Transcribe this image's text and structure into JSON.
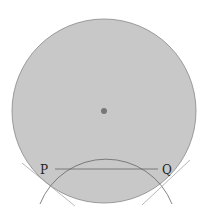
{
  "diagram": {
    "type": "geometry",
    "main_circle": {
      "cx": 104,
      "cy": 111,
      "r": 92,
      "fill": "#c8c8c8",
      "stroke": "#888888"
    },
    "center_point": {
      "cx": 104,
      "cy": 111,
      "r": 3,
      "fill": "#777777"
    },
    "arc_circle": {
      "cx": 106,
      "cy": 218,
      "r": 71,
      "stroke": "#666666"
    },
    "chord": {
      "x1": 55,
      "y1": 169,
      "x2": 158,
      "y2": 169
    },
    "points": [
      {
        "label": "P",
        "x": 44,
        "y": 172
      },
      {
        "label": "Q",
        "x": 162,
        "y": 172
      }
    ]
  }
}
